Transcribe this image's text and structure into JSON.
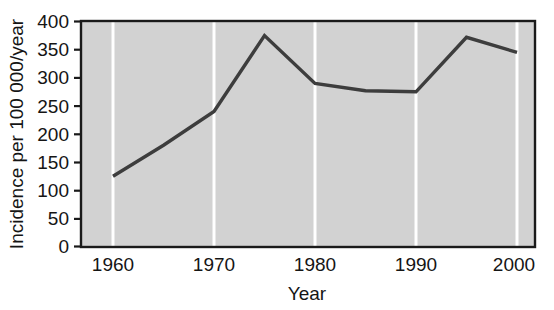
{
  "chart_data": {
    "type": "line",
    "title": "",
    "xlabel": "Year",
    "ylabel": "Incidence per 100 000/year",
    "xlim": [
      1957,
      2002
    ],
    "ylim": [
      0,
      400
    ],
    "grid": "vertical-white-gridlines-at-decades",
    "legend": "none",
    "plot_background": "#d2d2d2",
    "line_color": "#3d3d3d",
    "x": [
      1960,
      1965,
      1970,
      1975,
      1980,
      1985,
      1990,
      1995,
      2000
    ],
    "values": [
      125,
      180,
      240,
      375,
      290,
      277,
      275,
      372,
      345
    ],
    "series": [
      {
        "name": "Incidence",
        "x": [
          1960,
          1965,
          1970,
          1975,
          1980,
          1985,
          1990,
          1995,
          2000
        ],
        "values": [
          125,
          180,
          240,
          375,
          290,
          277,
          275,
          372,
          345
        ]
      }
    ],
    "xticks": [
      1960,
      1970,
      1980,
      1990,
      2000
    ],
    "xtick_labels": [
      "1960",
      "1970",
      "1980",
      "1990",
      "2000"
    ],
    "yticks": [
      0,
      50,
      100,
      150,
      200,
      250,
      300,
      350,
      400
    ],
    "ytick_labels": [
      "0",
      "50",
      "100",
      "150",
      "200",
      "250",
      "300",
      "350",
      "400"
    ]
  },
  "axes": {
    "y_axis_title": "Incidence per 100 000/year",
    "x_axis_title": "Year",
    "y_labels": {
      "t0": "0",
      "t1": "50",
      "t2": "100",
      "t3": "150",
      "t4": "200",
      "t5": "250",
      "t6": "300",
      "t7": "350",
      "t8": "400"
    },
    "x_labels": {
      "t0": "1960",
      "t1": "1970",
      "t2": "1980",
      "t3": "1990",
      "t4": "2000"
    }
  },
  "colors": {
    "plot_fill": "#d2d2d2",
    "gridline": "#ffffff",
    "line": "#3d3d3d",
    "axis": "#1a1a1a",
    "text": "#151515",
    "page_background": "#ffffff"
  }
}
